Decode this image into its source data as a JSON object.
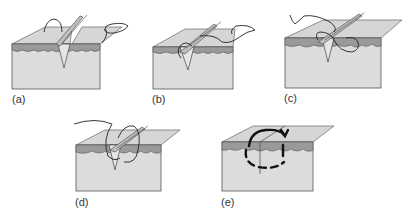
{
  "figure": {
    "colors": {
      "side_face": "#dcdcdc",
      "top_face": "#d6d6d6",
      "dermis_layer": "#9a9a9a",
      "thread": "#222222",
      "outline": "#555555"
    },
    "panels": [
      {
        "id": "a",
        "label": "(a)"
      },
      {
        "id": "b",
        "label": "(b)"
      },
      {
        "id": "c",
        "label": "(c)"
      },
      {
        "id": "d",
        "label": "(d)"
      },
      {
        "id": "e",
        "label": "(e)"
      }
    ]
  }
}
